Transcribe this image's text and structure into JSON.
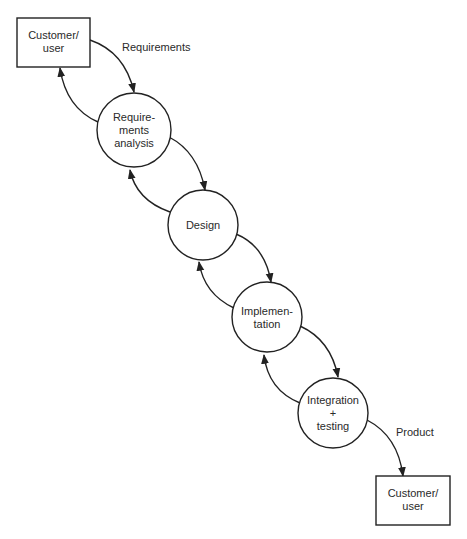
{
  "diagram": {
    "type": "waterfall-process-flow",
    "colors": {
      "stroke": "#222222",
      "text": "#2a2a2a",
      "background": "#ffffff"
    },
    "nodes": {
      "customer_top": {
        "shape": "rectangle",
        "lines": [
          "Customer/",
          "user"
        ]
      },
      "requirements_analysis": {
        "shape": "circle",
        "lines": [
          "Require-",
          "ments",
          "analysis"
        ]
      },
      "design": {
        "shape": "circle",
        "lines": [
          "Design"
        ]
      },
      "implementation": {
        "shape": "circle",
        "lines": [
          "Implemen-",
          "tation"
        ]
      },
      "integration_testing": {
        "shape": "circle",
        "lines": [
          "Integration",
          "+",
          "testing"
        ]
      },
      "customer_bottom": {
        "shape": "rectangle",
        "lines": [
          "Customer/",
          "user"
        ]
      }
    },
    "edge_labels": {
      "requirements": "Requirements",
      "product": "Product"
    },
    "edges": [
      {
        "from": "customer_top",
        "to": "requirements_analysis",
        "label": "Requirements"
      },
      {
        "from": "requirements_analysis",
        "to": "customer_top",
        "label": ""
      },
      {
        "from": "requirements_analysis",
        "to": "design",
        "label": ""
      },
      {
        "from": "design",
        "to": "requirements_analysis",
        "label": ""
      },
      {
        "from": "design",
        "to": "implementation",
        "label": ""
      },
      {
        "from": "implementation",
        "to": "design",
        "label": ""
      },
      {
        "from": "implementation",
        "to": "integration_testing",
        "label": ""
      },
      {
        "from": "integration_testing",
        "to": "implementation",
        "label": ""
      },
      {
        "from": "integration_testing",
        "to": "customer_bottom",
        "label": "Product"
      }
    ]
  }
}
